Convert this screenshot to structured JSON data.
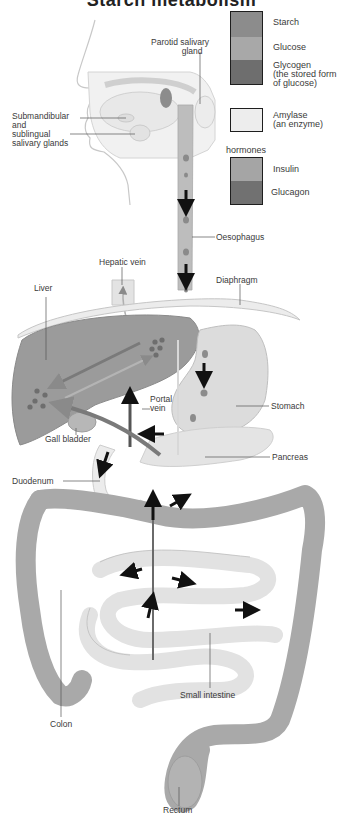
{
  "title": "Starch metabolism",
  "legend": {
    "items": [
      {
        "label": "Starch",
        "color": "#8c8c8c"
      },
      {
        "label": "Glucose",
        "color": "#a8a8a8"
      },
      {
        "label": "Glycogen\n(the stored form\nof glucose)",
        "color": "#6e6e6e"
      },
      {
        "label": "Amylase\n(an enzyme)",
        "color": "#ededed"
      }
    ],
    "hormones_heading": "hormones",
    "hormones": [
      {
        "label": "Insulin",
        "color": "#a5a5a5"
      },
      {
        "label": "Glucagon",
        "color": "#717171"
      }
    ]
  },
  "labels": {
    "parotid": "Parotid salivary\n             gland",
    "submandibular": "Submandibular\nand\nsublingual\nsalivary glands",
    "oesophagus": "Oesophagus",
    "hepatic_vein": "Hepatic vein",
    "diaphragm": "Diaphragm",
    "liver": "Liver",
    "portal_vein": "Portal\nvein",
    "stomach": "Stomach",
    "gall_bladder": "Gall bladder",
    "pancreas": "Pancreas",
    "duodenum": "Duodenum",
    "small_intestine": "Small intestine",
    "colon": "Colon",
    "rectum": "Rectum"
  }
}
